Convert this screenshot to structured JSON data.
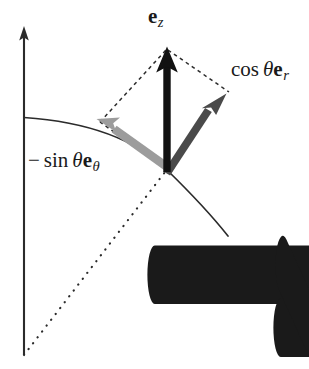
{
  "figure": {
    "background_color": "#ffffff",
    "width": 309,
    "height": 369
  },
  "colors": {
    "axis": "#2b2b2b",
    "arc": "#2b2b2b",
    "vector_ez": "#111111",
    "vector_cos_er": "#4a4a4a",
    "vector_neg_sin_etheta": "#9a9a9a",
    "construction_dashed": "#2b2b2b",
    "radial_dotted": "#2b2b2b",
    "label_text": "#1a1a1a"
  },
  "labels": {
    "ez": {
      "text": "e⃗_z",
      "base": "e",
      "subscript": "z",
      "accent": "vector-arrow",
      "plain": "⃗e_z"
    },
    "cos_er": {
      "text": "cos θ e⃗_r",
      "prefix": "cos",
      "angle": "θ",
      "base": "e",
      "subscript": "r",
      "accent": "vector-arrow",
      "clipped_at_right_edge": true
    },
    "neg_sin_etheta": {
      "text": "− sin θ e⃗_θ",
      "sign": "−",
      "prefix": "sin",
      "angle": "θ",
      "base": "e",
      "subscript": "θ",
      "accent": "vector-arrow"
    }
  },
  "geometry": {
    "origin": {
      "x": 167,
      "y": 170
    },
    "vertical_axis": {
      "x": 24,
      "y_top_tip": 27,
      "y_bottom": 355,
      "has_arrowhead": true,
      "arrowhead_at": "top"
    },
    "arc": {
      "start": {
        "x": 24,
        "y": 118
      },
      "through": {
        "x": 167,
        "y": 170
      },
      "end": {
        "x": 228,
        "y": 235
      },
      "style": "solid"
    },
    "radial_dotted_line": {
      "from": {
        "x": 24,
        "y": 355
      },
      "to": {
        "x": 167,
        "y": 170
      },
      "style": "dotted"
    },
    "vectors": [
      {
        "name": "ez",
        "from": {
          "x": 167,
          "y": 170
        },
        "to": {
          "x": 167,
          "y": 48
        },
        "color": "#111111",
        "shaft_width": 7,
        "label_ref": "ez"
      },
      {
        "name": "cos_er",
        "from": {
          "x": 167,
          "y": 170
        },
        "to": {
          "x": 225,
          "y": 95
        },
        "color": "#4a4a4a",
        "shaft_width": 7,
        "label_ref": "cos_er"
      },
      {
        "name": "neg_sin_etheta",
        "from": {
          "x": 167,
          "y": 170
        },
        "to": {
          "x": 97,
          "y": 120
        },
        "color": "#9a9a9a",
        "shaft_width": 8,
        "label_ref": "neg_sin_etheta"
      }
    ],
    "construction_parallelogram": {
      "style": "dashed",
      "points": [
        {
          "x": 167,
          "y": 170
        },
        {
          "x": 100,
          "y": 122
        },
        {
          "x": 167,
          "y": 48
        },
        {
          "x": 228,
          "y": 92
        }
      ]
    }
  }
}
